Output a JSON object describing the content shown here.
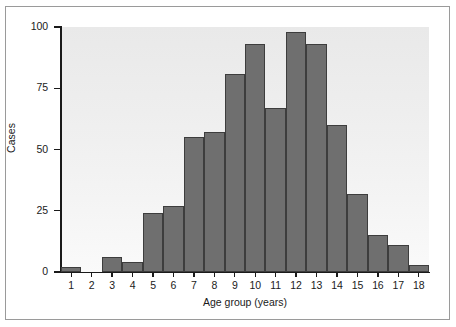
{
  "chart_data": {
    "type": "bar",
    "title": "",
    "subtitle": "",
    "xlabel": "Age group (years)",
    "ylabel": "Cases",
    "categories": [
      "1",
      "2",
      "3",
      "4",
      "5",
      "6",
      "7",
      "8",
      "9",
      "10",
      "11",
      "12",
      "13",
      "14",
      "15",
      "16",
      "17",
      "18"
    ],
    "values": [
      2,
      0,
      6,
      4,
      24,
      27,
      55,
      57,
      81,
      93,
      67,
      98,
      93,
      60,
      32,
      15,
      11,
      3
    ],
    "xlim": [
      0.5,
      18.5
    ],
    "ylim": [
      0,
      100
    ],
    "yticks": [
      0,
      25,
      50,
      75,
      100
    ],
    "ytick_labels": [
      "0",
      "25",
      "50",
      "75",
      "100"
    ],
    "xticks": [
      1,
      2,
      3,
      4,
      5,
      6,
      7,
      8,
      9,
      10,
      11,
      12,
      13,
      14,
      15,
      16,
      17,
      18
    ],
    "xtick_labels": [
      "1",
      "2",
      "3",
      "4",
      "5",
      "6",
      "7",
      "8",
      "9",
      "10",
      "11",
      "12",
      "13",
      "14",
      "15",
      "16",
      "17",
      "18"
    ],
    "grid": false,
    "legend": null,
    "legend_position": "none",
    "bar_color": "#6f6f6f",
    "bar_edge_color": "#3d3d3d",
    "plot_background": "#eeeeee",
    "figure_background": "#ffffff",
    "frame_border_color": "#9a9a9a",
    "axis_color": "#1a1a1a",
    "annotations": []
  }
}
